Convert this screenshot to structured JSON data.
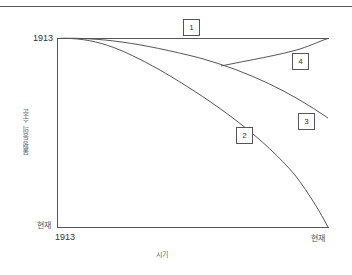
{
  "diagram": {
    "y_axis": {
      "title": "불평등의 수준",
      "top_label": "1913",
      "bottom_label": "현재"
    },
    "x_axis": {
      "title": "시기",
      "left_label": "1913",
      "right_label": "현재"
    },
    "curves": [
      {
        "id": "1",
        "label": "1",
        "description": "flat horizontal line at 1913 level"
      },
      {
        "id": "2",
        "label": "2",
        "description": "steeply declining curve reaching bottom at present"
      },
      {
        "id": "3",
        "label": "3",
        "description": "moderately declining curve"
      },
      {
        "id": "4",
        "label": "4",
        "description": "branches from curve 3 and rises back to 1913 level"
      }
    ],
    "colors": {
      "line": "#555555",
      "background": "#ffffff"
    }
  }
}
